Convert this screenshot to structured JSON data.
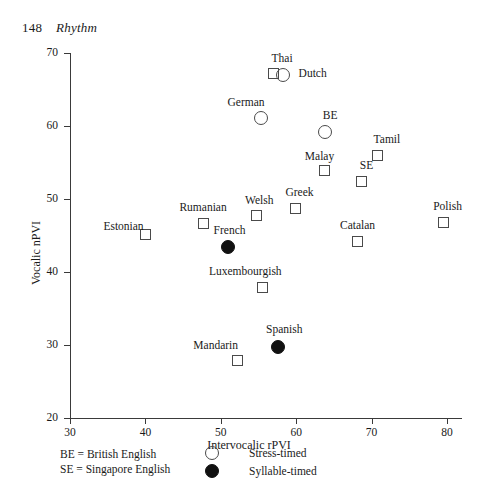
{
  "page": {
    "number": "148",
    "running_head": "Rhythm"
  },
  "chart_data": {
    "type": "scatter",
    "title": "",
    "xlabel": "Intervocalic rPVI",
    "ylabel": "Vocalic nPVI",
    "xlim": [
      30,
      82
    ],
    "ylim": [
      20,
      70
    ],
    "xticks": [
      30,
      40,
      50,
      60,
      70,
      80
    ],
    "yticks": [
      20,
      30,
      40,
      50,
      60,
      70
    ],
    "grid": false,
    "legend_position": "below-plot",
    "series": [
      {
        "name": "Stress-timed",
        "marker": "open-circle"
      },
      {
        "name": "Syllable-timed",
        "marker": "filled-circle"
      },
      {
        "name": "Other",
        "marker": "open-square"
      }
    ],
    "points": [
      {
        "label": "Thai",
        "x": 57.0,
        "y": 67.2,
        "marker": "square",
        "label_dx": -2,
        "label_dy": -15
      },
      {
        "label": "Dutch",
        "x": 58.2,
        "y": 67.0,
        "marker": "circle",
        "label_dx": 16,
        "label_dy": -2
      },
      {
        "label": "German",
        "x": 55.4,
        "y": 61.1,
        "marker": "circle",
        "label_dx": -34,
        "label_dy": -16
      },
      {
        "label": "BE",
        "x": 63.8,
        "y": 59.2,
        "marker": "circle",
        "label_dx": -2,
        "label_dy": -17
      },
      {
        "label": "Tamil",
        "x": 70.8,
        "y": 56.0,
        "marker": "square",
        "label_dx": -4,
        "label_dy": -16
      },
      {
        "label": "Malay",
        "x": 63.8,
        "y": 53.9,
        "marker": "square",
        "label_dx": -20,
        "label_dy": -15
      },
      {
        "label": "SE",
        "x": 68.7,
        "y": 52.4,
        "marker": "square",
        "label_dx": -2,
        "label_dy": -16
      },
      {
        "label": "Greek",
        "x": 59.9,
        "y": 48.7,
        "marker": "square",
        "label_dx": -10,
        "label_dy": -16
      },
      {
        "label": "Welsh",
        "x": 54.8,
        "y": 47.7,
        "marker": "square",
        "label_dx": -12,
        "label_dy": -16
      },
      {
        "label": "Rumanian",
        "x": 47.7,
        "y": 46.7,
        "marker": "square",
        "label_dx": -24,
        "label_dy": -16
      },
      {
        "label": "Polish",
        "x": 79.5,
        "y": 46.8,
        "marker": "square",
        "label_dx": -10,
        "label_dy": -16
      },
      {
        "label": "Estonian",
        "x": 40.0,
        "y": 45.1,
        "marker": "square",
        "label_dx": -42,
        "label_dy": -9
      },
      {
        "label": "Catalan",
        "x": 68.2,
        "y": 44.2,
        "marker": "square",
        "label_dx": -18,
        "label_dy": -16
      },
      {
        "label": "French",
        "x": 50.9,
        "y": 43.4,
        "marker": "filled-circle",
        "label_dx": -14,
        "label_dy": -17
      },
      {
        "label": "Luxembourgish",
        "x": 55.6,
        "y": 37.9,
        "marker": "square",
        "label_dx": -54,
        "label_dy": -16
      },
      {
        "label": "Spanish",
        "x": 57.6,
        "y": 29.7,
        "marker": "filled-circle",
        "label_dx": -12,
        "label_dy": -18
      },
      {
        "label": "Mandarin",
        "x": 52.2,
        "y": 27.9,
        "marker": "square",
        "label_dx": -44,
        "label_dy": -15
      }
    ]
  },
  "legend": {
    "abbrev_1": "BE = British English",
    "abbrev_2": "SE = Singapore English",
    "key_1": "Stress-timed",
    "key_2": "Syllable-timed"
  }
}
